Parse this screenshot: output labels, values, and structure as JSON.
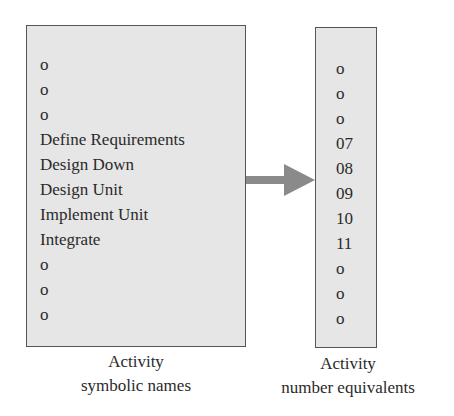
{
  "diagram": {
    "left_box": {
      "items": [
        "o",
        "o",
        "o",
        "Define Requirements",
        "Design Down",
        "Design Unit",
        "Implement Unit",
        "Integrate",
        "o",
        "o",
        "o"
      ],
      "caption_line1": "Activity",
      "caption_line2": "symbolic names"
    },
    "right_box": {
      "items": [
        "o",
        "o",
        "o",
        "07",
        "08",
        "09",
        "10",
        "11",
        "o",
        "o",
        "o"
      ],
      "caption_line1": "Activity",
      "caption_line2": "number equivalents"
    },
    "arrow": {
      "direction": "right",
      "color": "#8a8a8a"
    },
    "colors": {
      "box_fill": "#e6e6e6",
      "box_border": "#555555",
      "text": "#2a2a2a"
    }
  }
}
